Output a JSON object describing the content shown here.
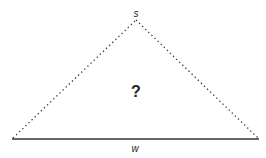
{
  "diagram": {
    "type": "triangle",
    "labels": {
      "apex": "s",
      "center": "?",
      "base": "w"
    },
    "sides": {
      "left": "dotted",
      "right": "dotted",
      "base": "solid"
    },
    "colors": {
      "line": "#333333",
      "background": "#ffffff"
    }
  }
}
